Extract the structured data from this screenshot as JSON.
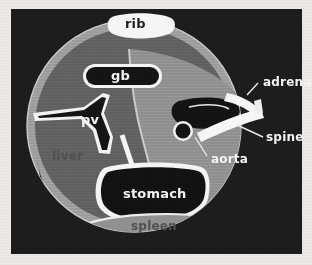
{
  "figure": {
    "type": "anatomical-cross-section",
    "modality": "abdominal transverse section schematic",
    "background_color": "#1a1a1a",
    "paper_color": "#eceae6",
    "body_wall_color": "#9a9a9a",
    "liver_color": "#5d5d5d",
    "lumen_color": "#141414",
    "outline_color": "#ffffff"
  },
  "labels": {
    "rib": "rib",
    "gb": "gb",
    "pv": "pv",
    "liver": "liver",
    "stomach": "stomach",
    "spleen": "spleen",
    "adrenal": "adrenal",
    "spine": "spine",
    "aorta": "aorta"
  },
  "structures": [
    {
      "name": "rib",
      "label": "rib",
      "label_style": "dark-on-white-blob",
      "position": "top-center"
    },
    {
      "name": "gallbladder",
      "label": "gb",
      "label_style": "white-on-dark",
      "position": "upper-center"
    },
    {
      "name": "portal-vein",
      "label": "pv",
      "label_style": "white-on-dark",
      "position": "center-left"
    },
    {
      "name": "liver",
      "label": "liver",
      "label_style": "dark-on-gray",
      "position": "left"
    },
    {
      "name": "stomach",
      "label": "stomach",
      "label_style": "white-on-dark",
      "position": "lower-center"
    },
    {
      "name": "spleen",
      "label": "spleen",
      "label_style": "dark-on-gray",
      "position": "bottom-center"
    },
    {
      "name": "adrenal",
      "label": "adrenal",
      "label_style": "white-outside",
      "position": "right-upper",
      "has_leader": true
    },
    {
      "name": "spine",
      "label": "spine",
      "label_style": "white-outside",
      "position": "right-middle",
      "has_leader": true
    },
    {
      "name": "aorta",
      "label": "aorta",
      "label_style": "white-outside",
      "position": "right-lower",
      "has_leader": true
    }
  ]
}
